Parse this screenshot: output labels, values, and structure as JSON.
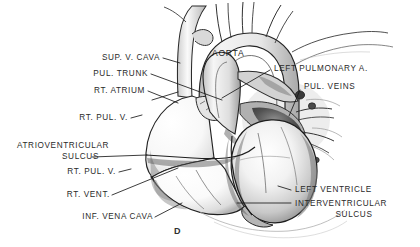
{
  "figure": {
    "letter": "D",
    "medium": "pencil and wash anatomical illustration",
    "background_color": "#ffffff",
    "label_color": "#2a2a2a",
    "leader_color": "#1a1a1a"
  },
  "labels": {
    "sup_v_cava": "SUP. V. CAVA",
    "pul_trunk": "PUL. TRUNK",
    "rt_atrium": "RT. ATRIUM",
    "rt_pul_v_upper": "RT. PUL. V.",
    "atrioventricular": "ATRIOVENTRICULAR",
    "sulcus_1": "SULCUS",
    "rt_pul_v_lower": "RT. PUL. V.",
    "rt_vent": "RT. VENT.",
    "inf_vena_cava": "INF. VENA CAVA",
    "aorta": "AORTA",
    "left_pulmonary_a": "LEFT PULMONARY A.",
    "pul_veins": "PUL. VEINS",
    "left_ventricle": "LEFT VENTRICLE",
    "interventricular": "INTERVENTRICULAR",
    "sulcus_2": "SULCUS"
  }
}
